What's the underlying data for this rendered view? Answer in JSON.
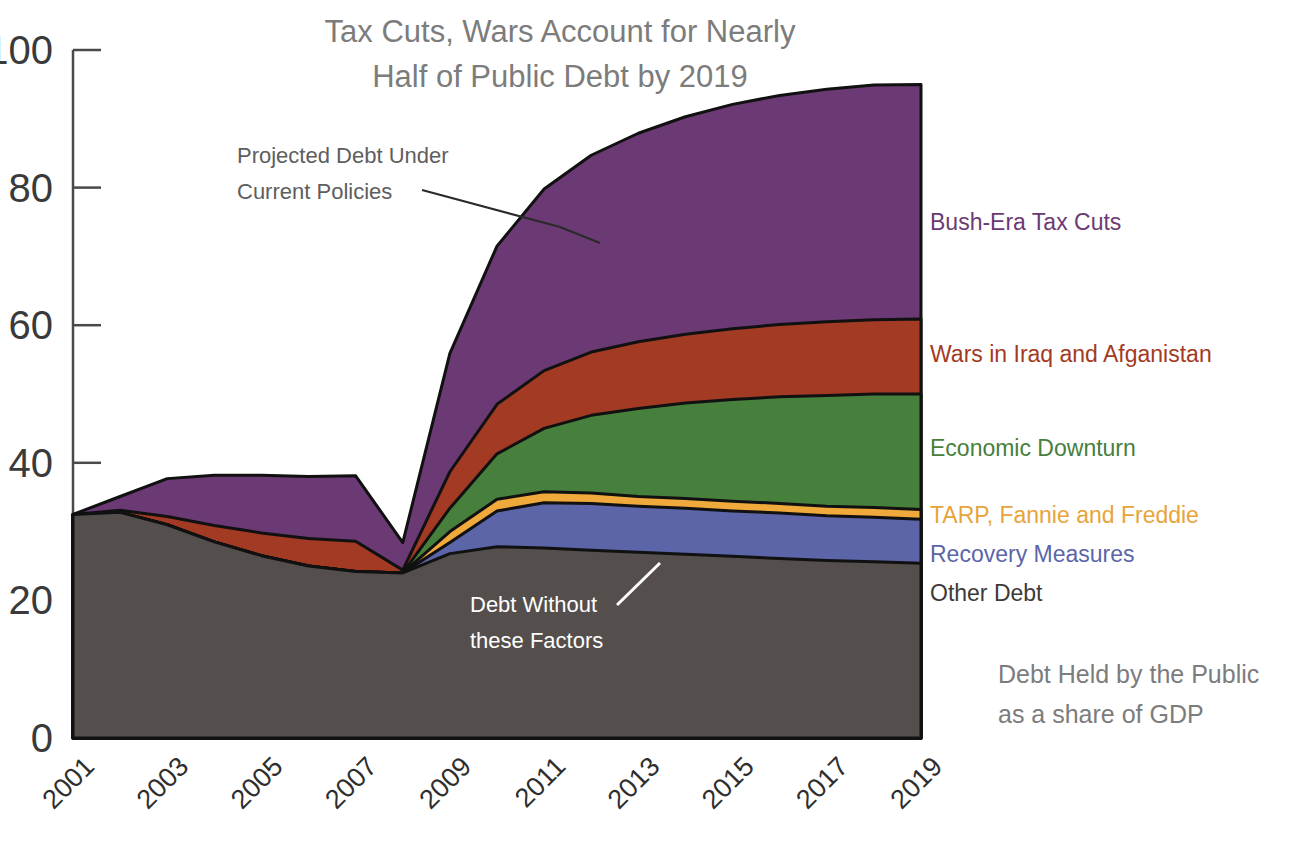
{
  "chart_data": {
    "type": "area",
    "stacked": true,
    "title": "Tax Cuts, Wars Account for Nearly Half of Public Debt by 2019",
    "title_line1": "Tax Cuts, Wars Account for Nearly",
    "title_line2": "Half of Public Debt by 2019",
    "xlabel": "",
    "ylabel": "",
    "ylim": [
      0,
      100
    ],
    "xlim": [
      2001,
      2019
    ],
    "yticks": [
      0,
      20,
      40,
      60,
      80,
      100
    ],
    "grid": false,
    "legend_position": "right-inline",
    "caption_line1": "Debt Held by the Public",
    "caption_line2": "as a share of GDP",
    "x": [
      2001,
      2002,
      2003,
      2004,
      2005,
      2006,
      2007,
      2008,
      2009,
      2010,
      2011,
      2012,
      2013,
      2014,
      2015,
      2016,
      2017,
      2018,
      2019
    ],
    "series": [
      {
        "name": "Other Debt",
        "label": "Other Debt",
        "color": "#544F4C",
        "text_color": "#3e3a38",
        "values": [
          32.5,
          32.8,
          31.0,
          28.5,
          26.5,
          25.0,
          24.2,
          24.0,
          26.8,
          27.8,
          27.6,
          27.3,
          27.0,
          26.7,
          26.4,
          26.1,
          25.8,
          25.6,
          25.4
        ]
      },
      {
        "name": "Recovery Measures",
        "label": "Recovery Measures",
        "color": "#5B65A8",
        "text_color": "#5B65A8",
        "values": [
          0,
          0,
          0,
          0,
          0,
          0,
          0,
          0,
          1.6,
          5.2,
          6.6,
          6.8,
          6.7,
          6.7,
          6.6,
          6.6,
          6.5,
          6.5,
          6.4
        ]
      },
      {
        "name": "TARP, Fannie and Freddie",
        "label": "TARP, Fannie and Freddie",
        "color": "#F0A93B",
        "text_color": "#E8A43A",
        "values": [
          0,
          0,
          0,
          0,
          0,
          0,
          0,
          0,
          1.6,
          1.7,
          1.6,
          1.5,
          1.4,
          1.4,
          1.4,
          1.4,
          1.4,
          1.4,
          1.4
        ]
      },
      {
        "name": "Economic Downturn",
        "label": "Economic Downturn",
        "color": "#47803C",
        "text_color": "#47803C",
        "values": [
          0,
          0,
          0,
          0,
          0,
          0,
          0,
          0,
          3.4,
          6.6,
          9.2,
          11.3,
          12.8,
          13.9,
          14.8,
          15.5,
          16.1,
          16.5,
          16.8
        ]
      },
      {
        "name": "Wars in Iraq and Afganistan",
        "label": "Wars in Iraq and Afganistan",
        "color": "#A33A23",
        "text_color": "#A33A23",
        "values": [
          0,
          0.3,
          1.2,
          2.4,
          3.3,
          4.0,
          4.4,
          0.4,
          5.3,
          7.2,
          8.4,
          9.2,
          9.7,
          10.0,
          10.3,
          10.5,
          10.7,
          10.8,
          10.9
        ]
      },
      {
        "name": "Bush-Era Tax Cuts",
        "label": "Bush-Era Tax Cuts",
        "color": "#6B3A74",
        "text_color": "#6B3A74",
        "values": [
          0,
          2.0,
          5.5,
          7.3,
          8.4,
          9.0,
          9.5,
          4.0,
          17.2,
          23.0,
          26.4,
          28.6,
          30.3,
          31.6,
          32.6,
          33.3,
          33.8,
          34.1,
          34.1
        ]
      }
    ],
    "xticks": [
      {
        "label": "2001",
        "value": 2001
      },
      {
        "label": "2003",
        "value": 2003
      },
      {
        "label": "2005",
        "value": 2005
      },
      {
        "label": "2007",
        "value": 2007
      },
      {
        "label": "2009",
        "value": 2009
      },
      {
        "label": "2011",
        "value": 2011
      },
      {
        "label": "2013",
        "value": 2013
      },
      {
        "label": "2015",
        "value": 2015
      },
      {
        "label": "2017",
        "value": 2017
      },
      {
        "label": "2019",
        "value": 2019
      }
    ],
    "annotations": [
      {
        "id": "projected-debt",
        "line1": "Projected Debt Under",
        "line2": "Current Policies",
        "color": "#5e5e5e"
      },
      {
        "id": "debt-without",
        "line1": "Debt Without",
        "line2": "these Factors",
        "color": "#ffffff"
      }
    ]
  }
}
